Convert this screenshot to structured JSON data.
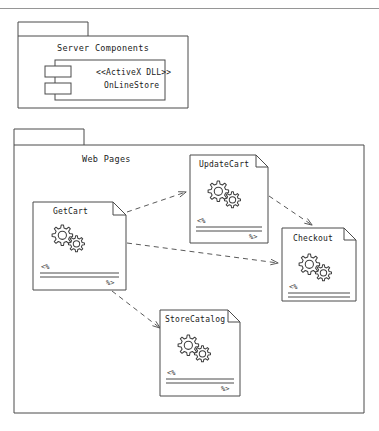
{
  "diagram": {
    "type": "uml-component-diagram",
    "top_rule": true,
    "stroke_color": "#4a4a4a",
    "fill_color": "#ffffff",
    "text_color": "#1a1a1a",
    "packages": [
      {
        "id": "server-components",
        "name": "Server Components",
        "x": 18,
        "y": 28,
        "w": 170,
        "h": 80,
        "tab": {
          "x": 18,
          "y": 22,
          "w": 70,
          "h": 14
        },
        "components": [
          {
            "id": "onlinestore",
            "stereotype": "<<ActiveX DLL>>",
            "name": "OnLineStore",
            "x": 55,
            "y": 60,
            "w": 110,
            "h": 40
          }
        ]
      },
      {
        "id": "web-pages",
        "name": "Web Pages",
        "x": 14,
        "y": 143,
        "w": 350,
        "h": 270,
        "tab": {
          "x": 14,
          "y": 129,
          "w": 70,
          "h": 16
        },
        "pages": [
          {
            "id": "getcart",
            "name": "GetCart",
            "x": 33,
            "y": 202,
            "w": 93,
            "h": 88,
            "show_close_tag": true
          },
          {
            "id": "updatecart",
            "name": "UpdateCart",
            "x": 190,
            "y": 155,
            "w": 78,
            "h": 88,
            "show_close_tag": true
          },
          {
            "id": "checkout",
            "name": "Checkout",
            "x": 282,
            "y": 228,
            "w": 74,
            "h": 73,
            "show_close_tag": false
          },
          {
            "id": "storecatalog",
            "name": "StoreCatalog",
            "x": 160,
            "y": 310,
            "w": 80,
            "h": 86,
            "show_close_tag": true
          }
        ],
        "dependencies": [
          {
            "id": "getcart-to-updatecart",
            "from": "getcart",
            "to": "updatecart",
            "style": "dashed"
          },
          {
            "id": "getcart-to-checkout",
            "from": "getcart",
            "to": "checkout",
            "style": "dashed"
          },
          {
            "id": "getcart-to-storecatalog",
            "from": "getcart",
            "to": "storecatalog",
            "style": "dashed"
          },
          {
            "id": "updatecart-to-checkout",
            "from": "updatecart",
            "to": "checkout",
            "style": "dashed"
          }
        ]
      }
    ],
    "asp_markers": {
      "open": "<%",
      "close": "%>"
    }
  }
}
